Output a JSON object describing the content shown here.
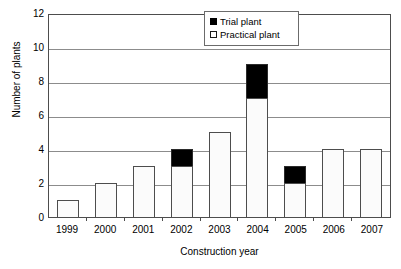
{
  "chart_data": {
    "type": "bar",
    "stacked": true,
    "title": "",
    "xlabel": "Construction year",
    "ylabel": "Number of plants",
    "categories": [
      "1999",
      "2000",
      "2001",
      "2002",
      "2003",
      "2004",
      "2005",
      "2006",
      "2007"
    ],
    "series": [
      {
        "name": "Practical plant",
        "values": [
          1,
          2,
          3,
          3,
          5,
          7,
          2,
          4,
          4
        ],
        "color": "#FFFFFF"
      },
      {
        "name": "Trial plant",
        "values": [
          0,
          0,
          0,
          1,
          0,
          2,
          1,
          0,
          0
        ],
        "color": "#000000"
      }
    ],
    "totals": [
      1,
      2,
      3,
      4,
      5,
      9,
      3,
      4,
      4
    ],
    "ylim": [
      0,
      12
    ],
    "ytick_labels": [
      "0",
      "2",
      "4",
      "6",
      "8",
      "10",
      "12"
    ],
    "ytick_values": [
      0,
      2,
      4,
      6,
      8,
      10,
      12
    ],
    "ytick_step": 2,
    "grid": "horizontal",
    "legend_position": "top-right-inside",
    "legend_entries": [
      "Trial plant",
      "Practical plant"
    ]
  },
  "axes": {
    "y_title": "Number of plants",
    "x_title": "Construction year"
  },
  "legend": {
    "items": [
      {
        "label": "Trial plant",
        "swatch": "filled-black-square-icon"
      },
      {
        "label": "Practical plant",
        "swatch": "outlined-white-square-icon"
      }
    ]
  },
  "colors": {
    "trial": "#000000",
    "practical": "#FBFBFB",
    "bar_outline": "#4D4D4D",
    "gridline": "#8C8C8C",
    "frame": "#4D4D4D",
    "background": "#FFFFFF",
    "text": "#000000"
  }
}
